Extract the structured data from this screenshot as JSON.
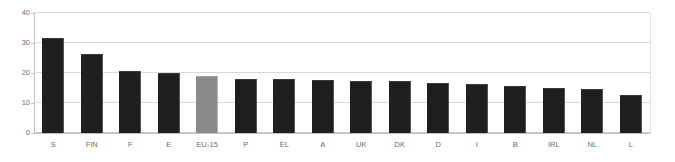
{
  "chart_data": {
    "type": "bar",
    "title": "",
    "subtitle": "",
    "xlabel": "",
    "ylabel": "",
    "ylim": [
      0,
      40
    ],
    "yticks": [
      0,
      10,
      20,
      30,
      40
    ],
    "grid": true,
    "legend": false,
    "legend_position": "none",
    "categories": [
      "S",
      "FIN",
      "F",
      "E",
      "EU-15",
      "P",
      "EL",
      "A",
      "UK",
      "DK",
      "D",
      "I",
      "B",
      "IRL",
      "NL",
      "L"
    ],
    "values": [
      31.8,
      26.5,
      20.7,
      19.9,
      19.1,
      17.9,
      17.9,
      17.7,
      17.4,
      17.2,
      16.8,
      16.4,
      15.6,
      15.1,
      14.7,
      12.7
    ],
    "bar_colors": [
      "#1f1f1f",
      "#1f1f1f",
      "#1f1f1f",
      "#1f1f1f",
      "#8a8a8a",
      "#1f1f1f",
      "#1f1f1f",
      "#1f1f1f",
      "#1f1f1f",
      "#1f1f1f",
      "#1f1f1f",
      "#1f1f1f",
      "#1f1f1f",
      "#1f1f1f",
      "#1f1f1f",
      "#1f1f1f"
    ],
    "highlight_category": "EU-15",
    "colors": {
      "bar_default": "#1f1f1f",
      "bar_highlight": "#8a8a8a",
      "gridline": "#d9d9d9",
      "axis": "#c2c2c2",
      "tick_text": "#707070",
      "background": "#ffffff"
    }
  }
}
